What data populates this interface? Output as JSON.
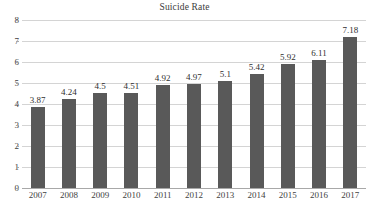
{
  "chart_data": {
    "type": "bar",
    "title": "Suicide Rate",
    "xlabel": "",
    "ylabel": "",
    "categories": [
      "2007",
      "2008",
      "2009",
      "2010",
      "2011",
      "2012",
      "2013",
      "2014",
      "2015",
      "2016",
      "2017"
    ],
    "values": [
      3.87,
      4.24,
      4.5,
      4.51,
      4.92,
      4.97,
      5.1,
      5.42,
      5.92,
      6.11,
      7.18
    ],
    "value_labels": [
      "3.87",
      "4.24",
      "4.5",
      "4.51",
      "4.92",
      "4.97",
      "5.1",
      "5.42",
      "5.92",
      "6.11",
      "7.18"
    ],
    "ylim": [
      0,
      8
    ],
    "ytick_labels": [
      "8",
      "7",
      "6",
      "5",
      "4",
      "3",
      "2",
      "1",
      "0"
    ],
    "ytick_values": [
      8,
      7,
      6,
      5,
      4,
      3,
      2,
      1,
      0
    ],
    "grid": true,
    "grid_orientation": "horizontal",
    "legend": false,
    "legend_position": "none",
    "bar_color": "#595959",
    "grid_color": "#d4d4d4",
    "axis_color": "#a8a8a8",
    "background_color": "#ffffff",
    "title_color": "#3b3b3b",
    "label_color": "#2f2f2f",
    "tick_color": "#3f3f3f"
  }
}
